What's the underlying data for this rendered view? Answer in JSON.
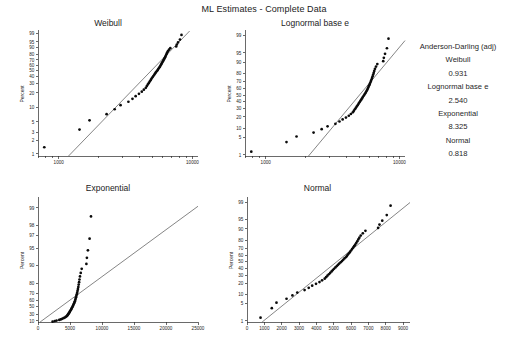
{
  "title": "ML Estimates - Complete Data",
  "panels": {
    "weibull": {
      "title": "Weibull",
      "ylabel": "Percent",
      "xscale": "log",
      "xlim": [
        700,
        11000
      ],
      "xticks_labeled": [
        "1000",
        "10000"
      ],
      "yticks": [
        "1",
        "2",
        "3",
        "5",
        "10",
        "20",
        "30",
        "40",
        "50",
        "60",
        "70",
        "80",
        "90",
        "95",
        "99"
      ]
    },
    "lognormal": {
      "title": "Lognormal base e",
      "ylabel": "Percent",
      "xscale": "log",
      "xlim": [
        700,
        11000
      ],
      "xticks_labeled": [
        "1000",
        "10000"
      ],
      "yticks": [
        "1",
        "5",
        "10",
        "20",
        "30",
        "40",
        "50",
        "60",
        "70",
        "80",
        "90",
        "95",
        "99"
      ]
    },
    "exponential": {
      "title": "Exponential",
      "ylabel": "Percent",
      "xscale": "linear",
      "xlim": [
        0,
        25000
      ],
      "xticks": [
        "0",
        "5000",
        "10000",
        "15000",
        "20000",
        "25000"
      ],
      "yticks": [
        "10",
        "30",
        "50",
        "60",
        "70",
        "80",
        "90",
        "95",
        "97",
        "98",
        "99"
      ]
    },
    "normal": {
      "title": "Normal",
      "ylabel": "Percent",
      "xscale": "linear",
      "xlim": [
        0,
        9400
      ],
      "xticks": [
        "0",
        "1000",
        "2000",
        "3000",
        "4000",
        "5000",
        "6000",
        "7000",
        "8000",
        "9000"
      ],
      "yticks": [
        "1",
        "5",
        "10",
        "20",
        "30",
        "40",
        "50",
        "60",
        "70",
        "80",
        "90",
        "95",
        "99"
      ]
    }
  },
  "stats": {
    "header": "Anderson-Darling (adj)",
    "entries": [
      {
        "name": "Weibull",
        "value": "0.931"
      },
      {
        "name": "Lognormal base e",
        "value": "2.540"
      },
      {
        "name": "Exponential",
        "value": "8.325"
      },
      {
        "name": "Normal",
        "value": "0.818"
      }
    ]
  },
  "chart_data": {
    "type": "scatter",
    "title": "ML Estimates - Complete Data",
    "subplot_layout": "2x2 probability plots with goodness-of-fit legend",
    "xlabel": "",
    "ylabel": "Percent",
    "grid": false,
    "legend_position": "right",
    "sample_size": 50,
    "observations": [
      780,
      1430,
      1700,
      2280,
      2620,
      2900,
      3320,
      3560,
      3760,
      3980,
      4180,
      4330,
      4480,
      4560,
      4640,
      4720,
      4800,
      4880,
      4950,
      5020,
      5100,
      5180,
      5250,
      5320,
      5400,
      5480,
      5550,
      5620,
      5700,
      5760,
      5820,
      5880,
      5940,
      6000,
      6060,
      6120,
      6180,
      6240,
      6300,
      6360,
      6420,
      6480,
      6560,
      6680,
      6830,
      7560,
      7640,
      7800,
      8060,
      8280
    ],
    "plotting_positions_percent": [
      1.4,
      3.4,
      5.4,
      7.3,
      9.3,
      11.3,
      13.3,
      15.3,
      17.3,
      19.2,
      21.2,
      23.2,
      25.2,
      27.2,
      29.2,
      31.1,
      33.1,
      35.1,
      37.1,
      39.1,
      41.1,
      43.1,
      45.0,
      47.0,
      49.0,
      51.0,
      53.0,
      55.0,
      56.9,
      58.9,
      60.9,
      62.9,
      64.9,
      66.9,
      68.9,
      70.8,
      72.8,
      74.8,
      76.8,
      78.8,
      80.8,
      82.7,
      84.7,
      86.7,
      88.7,
      90.7,
      92.7,
      94.6,
      96.6,
      98.6
    ],
    "series": [
      {
        "name": "Weibull",
        "anderson_darling_adj": 0.931
      },
      {
        "name": "Lognormal base e",
        "anderson_darling_adj": 2.54
      },
      {
        "name": "Exponential",
        "anderson_darling_adj": 8.325
      },
      {
        "name": "Normal",
        "anderson_darling_adj": 0.818
      }
    ]
  }
}
